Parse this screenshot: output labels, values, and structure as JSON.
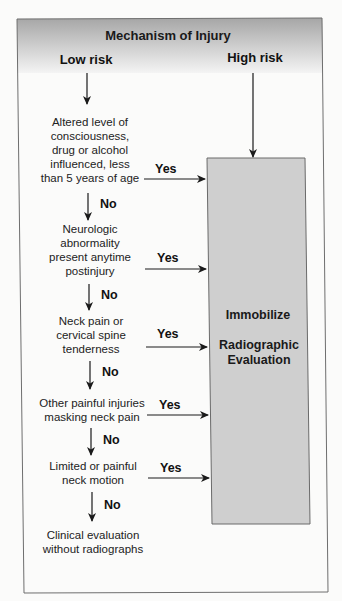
{
  "header": {
    "title": "Mechanism of Injury",
    "low_risk_label": "Low risk",
    "high_risk_label": "High risk"
  },
  "nodes": [
    {
      "lines": [
        "Altered level of",
        "consciousness,",
        "drug or alcohol",
        "influenced, less",
        "than 5 years of age"
      ],
      "yes_label": "Yes",
      "no_label": "No"
    },
    {
      "lines": [
        "Neurologic",
        "abnormality",
        "present anytime",
        "postinjury"
      ],
      "yes_label": "Yes",
      "no_label": "No"
    },
    {
      "lines": [
        "Neck pain or",
        "cervical spine",
        "tenderness"
      ],
      "yes_label": "Yes",
      "no_label": "No"
    },
    {
      "lines": [
        "Other painful injuries",
        "masking neck pain"
      ],
      "yes_label": "Yes",
      "no_label": "No"
    },
    {
      "lines": [
        "Limited or painful",
        "neck motion"
      ],
      "yes_label": "Yes",
      "no_label": "No"
    }
  ],
  "terminal": {
    "lines": [
      "Clinical evaluation",
      "without radiographs"
    ]
  },
  "action_box": {
    "line1": "Immobilize",
    "line2": "Radiographic",
    "line3": "Evaluation"
  },
  "colors": {
    "header_gradient_top": "#a9a9a9",
    "header_gradient_bottom": "#f2f2f2",
    "action_box_fill": "#cfcfcf",
    "frame_stroke": "#6e6e6e",
    "arrow": "#1a1a1a"
  }
}
